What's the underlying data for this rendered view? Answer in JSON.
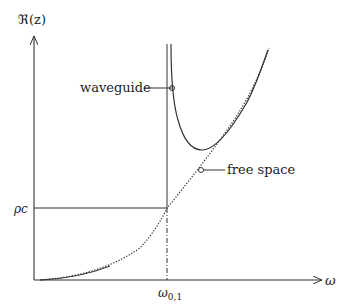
{
  "diagram": {
    "y_axis_label": "ℜ(z)",
    "x_axis_label": "ω",
    "y_tick_label": "ρc",
    "x_tick_label_main": "ω",
    "x_tick_label_sub": "0,1",
    "annotations": {
      "waveguide": "waveguide",
      "free_space": "free space"
    },
    "colors": {
      "stroke": "#333333",
      "background": "#ffffff"
    },
    "curves": [
      {
        "name": "waveguide",
        "style": "solid",
        "description": "impedance diverges at cutoff frequency ω0,1, dips to a minimum then approaches free-space curve"
      },
      {
        "name": "free space",
        "style": "dotted",
        "description": "parabolic curve from origin, crosses ρc at ω0,1"
      }
    ]
  }
}
